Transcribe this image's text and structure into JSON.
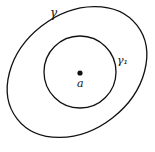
{
  "diagram": {
    "outer_curve": {
      "label": "γ",
      "cx": 77,
      "cy": 72,
      "rx": 76,
      "ry": 60,
      "rotate": -35
    },
    "inner_circle": {
      "label": "γ₁",
      "cx": 80,
      "cy": 72,
      "r": 36
    },
    "point": {
      "label": "a",
      "cx": 80,
      "cy": 73
    },
    "colors": {
      "stroke": "#111111",
      "background": "#ffffff"
    }
  }
}
